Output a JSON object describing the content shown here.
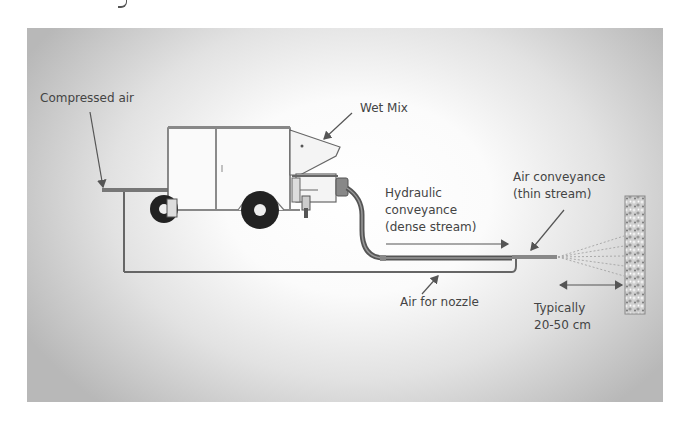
{
  "diagram": {
    "labels": {
      "compressed_air": "Compressed air",
      "wet_mix": "Wet Mix",
      "hydraulic_1": "Hydraulic",
      "hydraulic_2": "conveyance",
      "hydraulic_3": "(dense stream)",
      "air_conv_1": "Air conveyance",
      "air_conv_2": "(thin stream)",
      "air_nozzle": "Air for nozzle",
      "distance_1": "Typically",
      "distance_2": "20-50 cm"
    },
    "colors": {
      "line": "#555555",
      "hose": "#666666",
      "text": "#444444",
      "wall": "#9a9a9a"
    }
  }
}
